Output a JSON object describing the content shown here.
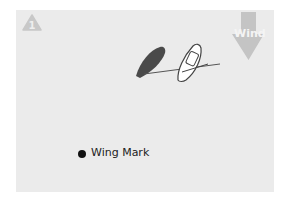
{
  "diagram": {
    "step_badge": {
      "icon": "warning-triangle-icon",
      "number": "1"
    },
    "wind_indicator": {
      "label": "Wind",
      "direction": "down",
      "icon": "arrow-down-icon"
    },
    "boats": [
      {
        "name": "dark-boat",
        "color": "#444444"
      },
      {
        "name": "white-boat",
        "color": "#ffffff"
      }
    ],
    "legend": {
      "marker_label": "Wing Mark",
      "marker_color": "#111111"
    }
  }
}
